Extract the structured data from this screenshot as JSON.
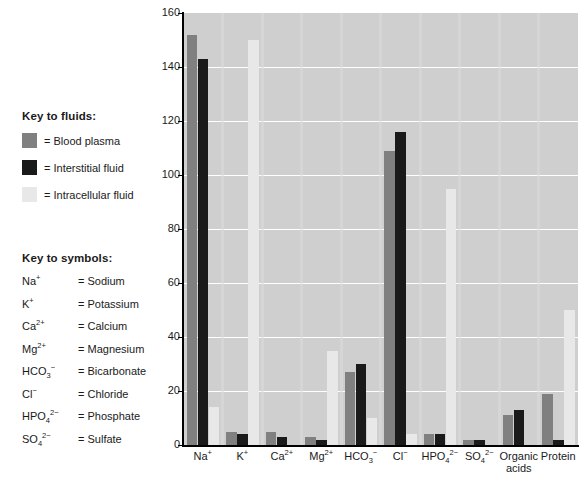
{
  "legend": {
    "heading": "Key to fluids:",
    "items": [
      {
        "label": "= Blood plasma",
        "color": "#808080"
      },
      {
        "label": "= Interstitial fluid",
        "color": "#1a1a1a"
      },
      {
        "label": "= Intracellular fluid",
        "color": "#e8e8e8"
      }
    ]
  },
  "symbols": {
    "heading": "Key to symbols:",
    "items": [
      {
        "formula_html": "Na<sup>+</sup>",
        "name": "= Sodium"
      },
      {
        "formula_html": "K<sup>+</sup>",
        "name": "= Potassium"
      },
      {
        "formula_html": "Ca<sup>2+</sup>",
        "name": "= Calcium"
      },
      {
        "formula_html": "Mg<sup>2+</sup>",
        "name": "= Magnesium"
      },
      {
        "formula_html": "HCO<sub>3</sub><sup>−</sup>",
        "name": "= Bicarbonate"
      },
      {
        "formula_html": "Cl<sup>−</sup>",
        "name": "= Chloride"
      },
      {
        "formula_html": "HPO<sub>4</sub><sup>2−</sup>",
        "name": "= Phosphate"
      },
      {
        "formula_html": "SO<sub>4</sub><sup>2−</sup>",
        "name": "= Sulfate"
      }
    ]
  },
  "chart_data": {
    "type": "bar",
    "title": "",
    "xlabel": "",
    "ylabel": "Total solute concentration (mEq/L)",
    "ylim": [
      0,
      160
    ],
    "yticks": [
      0,
      20,
      40,
      60,
      80,
      100,
      120,
      140,
      160
    ],
    "grid": true,
    "legend_position": "left-outside",
    "categories": [
      "Na+",
      "K+",
      "Ca2+",
      "Mg2+",
      "HCO3-",
      "Cl-",
      "HPO4 2-",
      "SO4 2-",
      "Organic acids",
      "Protein"
    ],
    "categories_html": [
      "Na<sup>+</sup>",
      "K<sup>+</sup>",
      "Ca<sup>2+</sup>",
      "Mg<sup>2+</sup>",
      "HCO<sub>3</sub><sup>−</sup>",
      "Cl<sup>−</sup>",
      "HPO<sub>4</sub><sup>2−</sup>",
      "SO<sub>4</sub><sup>2−</sup>",
      "Organic<br>acids",
      "Protein"
    ],
    "series": [
      {
        "name": "Blood plasma",
        "color": "#808080",
        "values": [
          152,
          5,
          5,
          3,
          27,
          109,
          4,
          2,
          11,
          19
        ]
      },
      {
        "name": "Interstitial fluid",
        "color": "#1a1a1a",
        "values": [
          143,
          4,
          3,
          2,
          30,
          116,
          4,
          2,
          13,
          2
        ]
      },
      {
        "name": "Intracellular fluid",
        "color": "#e8e8e8",
        "values": [
          14,
          150,
          0,
          35,
          10,
          4,
          95,
          0,
          0,
          50
        ]
      }
    ]
  }
}
